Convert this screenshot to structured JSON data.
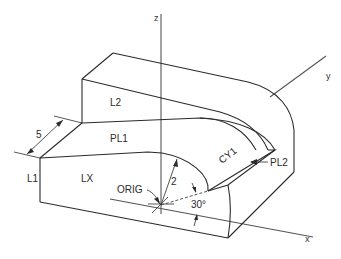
{
  "diagram": {
    "type": "isometric-solid-model",
    "axes": {
      "x": "x",
      "y": "y",
      "z": "z"
    },
    "surface_labels": {
      "l1": "L1",
      "l2": "L2",
      "lx": "LX",
      "pl1": "PL1",
      "pl2": "PL2",
      "cy1": "CY1",
      "orig": "ORIG"
    },
    "dimensions": {
      "thickness": "5",
      "radius": "2",
      "angle": "30°"
    },
    "colors": {
      "line": "#2b2b2b",
      "axis": "#555555",
      "background": "#ffffff"
    }
  }
}
